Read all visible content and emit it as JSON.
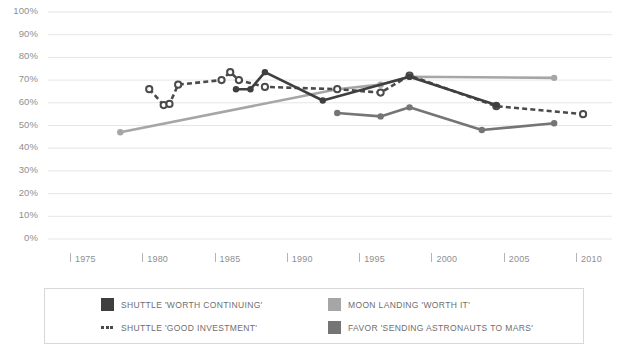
{
  "chart_data": {
    "type": "line",
    "title": "",
    "xlabel": "",
    "ylabel": "",
    "xlim": [
      1973,
      2012
    ],
    "ylim": [
      0,
      100
    ],
    "grid": true,
    "legend_position": "bottom",
    "y_ticks": [
      "100%",
      "90%",
      "80%",
      "70%",
      "60%",
      "50%",
      "40%",
      "30%",
      "20%",
      "10%",
      "0%"
    ],
    "y_tick_values": [
      100,
      90,
      80,
      70,
      60,
      50,
      40,
      30,
      20,
      10,
      0
    ],
    "x_ticks": [
      "1975",
      "1980",
      "1985",
      "1990",
      "1995",
      "2000",
      "2005",
      "2010"
    ],
    "x_tick_values": [
      1975,
      1980,
      1985,
      1990,
      1995,
      2000,
      2005,
      2010
    ],
    "series": [
      {
        "name": "SHUTTLE 'WORTH CONTINUING'",
        "color": "#3f3f3f",
        "style": "solid",
        "marker": "filled-circle",
        "points": [
          {
            "x": 1986,
            "y": 66
          },
          {
            "x": 1987,
            "y": 66
          },
          {
            "x": 1988,
            "y": 73.5
          },
          {
            "x": 1992,
            "y": 61
          },
          {
            "x": 1998,
            "y": 71.5
          },
          {
            "x": 2004,
            "y": 59
          }
        ]
      },
      {
        "name": "SHUTTLE 'GOOD INVESTMENT'",
        "color": "#4a4a4a",
        "style": "dashed",
        "marker": "open-circle",
        "points": [
          {
            "x": 1980,
            "y": 66
          },
          {
            "x": 1981,
            "y": 59
          },
          {
            "x": 1981.4,
            "y": 59.5
          },
          {
            "x": 1982,
            "y": 68
          },
          {
            "x": 1985,
            "y": 70
          },
          {
            "x": 1985.6,
            "y": 73.5
          },
          {
            "x": 1986.2,
            "y": 70
          },
          {
            "x": 1988,
            "y": 67
          },
          {
            "x": 1993,
            "y": 66
          },
          {
            "x": 1996,
            "y": 64.5
          },
          {
            "x": 1998,
            "y": 72
          },
          {
            "x": 2004,
            "y": 58.5
          },
          {
            "x": 2010,
            "y": 55
          }
        ]
      },
      {
        "name": "MOON LANDING 'WORTH IT'",
        "color": "#a6a6a6",
        "style": "solid",
        "marker": "filled-circle",
        "points": [
          {
            "x": 1978,
            "y": 47
          },
          {
            "x": 1993,
            "y": 66
          },
          {
            "x": 1996,
            "y": 68
          },
          {
            "x": 1998,
            "y": 71.5
          },
          {
            "x": 2008,
            "y": 71
          }
        ]
      },
      {
        "name": "FAVOR 'SENDING ASTRONAUTS TO MARS'",
        "color": "#757575",
        "style": "solid",
        "marker": "filled-circle",
        "points": [
          {
            "x": 1993,
            "y": 55.5
          },
          {
            "x": 1996,
            "y": 54
          },
          {
            "x": 1998,
            "y": 58
          },
          {
            "x": 2003,
            "y": 48
          },
          {
            "x": 2008,
            "y": 51
          }
        ]
      }
    ]
  },
  "legend": {
    "entries": [
      {
        "label": "SHUTTLE 'WORTH CONTINUING'",
        "color": "#3f3f3f",
        "swatch": "square"
      },
      {
        "label": "MOON LANDING 'WORTH IT'",
        "color": "#a6a6a6",
        "swatch": "square"
      },
      {
        "label": "SHUTTLE 'GOOD INVESTMENT'",
        "color": "#4a4a4a",
        "swatch": "dashes"
      },
      {
        "label": "FAVOR 'SENDING ASTRONAUTS TO MARS'",
        "color": "#757575",
        "swatch": "square"
      }
    ]
  },
  "colors": {
    "grid": "#e6e6e6",
    "axis_text": "#8f8f8f",
    "legend_border": "#d8d8d8",
    "background": "#ffffff"
  }
}
